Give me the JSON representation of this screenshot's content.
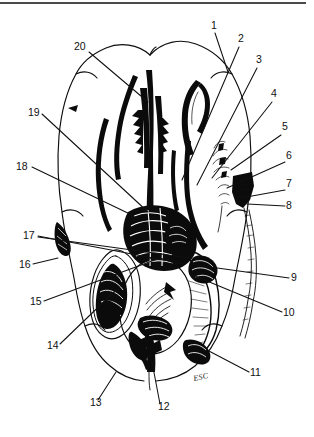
{
  "figure": {
    "signature": "ESC",
    "background_color": "#ffffff",
    "ink_color": "#0b0b0b",
    "label_color": "#111111",
    "scan_edge_color": "#4a4a4a"
  },
  "labels": [
    {
      "id": "1",
      "text": "1",
      "x": 211,
      "y": 29,
      "anchor": "start",
      "leader": [
        [
          215,
          33
        ],
        [
          228,
          72
        ]
      ]
    },
    {
      "id": "2",
      "text": "2",
      "x": 238,
      "y": 42,
      "anchor": "start",
      "leader": [
        [
          239,
          47
        ],
        [
          182,
          180
        ]
      ]
    },
    {
      "id": "3",
      "text": "3",
      "x": 256,
      "y": 63,
      "anchor": "start",
      "leader": [
        [
          257,
          68
        ],
        [
          197,
          185
        ]
      ]
    },
    {
      "id": "4",
      "text": "4",
      "x": 271,
      "y": 97,
      "anchor": "start",
      "leader": [
        [
          272,
          102
        ],
        [
          212,
          178
        ]
      ]
    },
    {
      "id": "5",
      "text": "5",
      "x": 282,
      "y": 130,
      "anchor": "start",
      "leader": [
        [
          281,
          135
        ],
        [
          231,
          170
        ]
      ]
    },
    {
      "id": "6",
      "text": "6",
      "x": 286,
      "y": 159,
      "anchor": "start",
      "leader": [
        [
          285,
          162
        ],
        [
          227,
          188
        ]
      ]
    },
    {
      "id": "7",
      "text": "7",
      "x": 286,
      "y": 187,
      "anchor": "start",
      "leader": [
        [
          285,
          190
        ],
        [
          241,
          198
        ]
      ]
    },
    {
      "id": "8",
      "text": "8",
      "x": 286,
      "y": 209,
      "anchor": "start",
      "leader": [
        [
          285,
          206
        ],
        [
          247,
          204
        ]
      ]
    },
    {
      "id": "9",
      "text": "9",
      "x": 291,
      "y": 281,
      "anchor": "start",
      "leader": [
        [
          289,
          278
        ],
        [
          203,
          266
        ]
      ]
    },
    {
      "id": "10",
      "text": "10",
      "x": 283,
      "y": 316,
      "anchor": "start",
      "leader": [
        [
          282,
          312
        ],
        [
          190,
          274
        ]
      ]
    },
    {
      "id": "11",
      "text": "11",
      "x": 250,
      "y": 376,
      "anchor": "start",
      "leader": [
        [
          249,
          372
        ],
        [
          207,
          350
        ]
      ]
    },
    {
      "id": "12",
      "text": "12",
      "x": 158,
      "y": 410,
      "anchor": "start",
      "leader": [
        [
          160,
          404
        ],
        [
          152,
          362
        ]
      ]
    },
    {
      "id": "13",
      "text": "13",
      "x": 90,
      "y": 406,
      "anchor": "start",
      "leader": [
        [
          98,
          400
        ],
        [
          116,
          372
        ]
      ]
    },
    {
      "id": "14",
      "text": "14",
      "x": 47,
      "y": 349,
      "anchor": "start",
      "leader": [
        [
          60,
          344
        ],
        [
          116,
          290
        ]
      ]
    },
    {
      "id": "15",
      "text": "15",
      "x": 30,
      "y": 305,
      "anchor": "start",
      "leader": [
        [
          44,
          301
        ],
        [
          160,
          258
        ]
      ]
    },
    {
      "id": "16",
      "text": "16",
      "x": 19,
      "y": 268,
      "anchor": "start",
      "leader": [
        [
          33,
          264
        ],
        [
          58,
          258
        ]
      ]
    },
    {
      "id": "17",
      "text": "17",
      "x": 23,
      "y": 239,
      "anchor": "start",
      "leader": [
        [
          38,
          236
        ],
        [
          184,
          264
        ]
      ]
    },
    {
      "id": "17b",
      "text": "",
      "x": 0,
      "y": 0,
      "anchor": "start",
      "leader": [
        [
          38,
          237
        ],
        [
          190,
          258
        ]
      ]
    },
    {
      "id": "18",
      "text": "18",
      "x": 16,
      "y": 170,
      "anchor": "start",
      "leader": [
        [
          32,
          167
        ],
        [
          134,
          216
        ]
      ]
    },
    {
      "id": "19",
      "text": "19",
      "x": 28,
      "y": 116,
      "anchor": "start",
      "leader": [
        [
          42,
          114
        ],
        [
          148,
          212
        ]
      ]
    },
    {
      "id": "20",
      "text": "20",
      "x": 74,
      "y": 50,
      "anchor": "start",
      "leader": [
        [
          89,
          52
        ],
        [
          148,
          102
        ]
      ]
    }
  ],
  "signature_position": {
    "x": 194,
    "y": 381
  }
}
